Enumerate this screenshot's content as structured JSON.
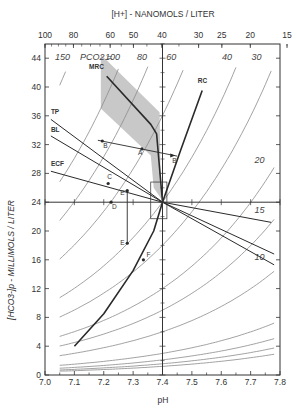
{
  "chart_data": {
    "type": "line",
    "title": "",
    "xlabel": "pH",
    "ylabel": "[HCO3-]p - MILLIMOLS / LITER",
    "top_axis_label": "[H+] - NANOMOLS / LITER",
    "xlim": [
      7.0,
      7.8
    ],
    "ylim": [
      0,
      46
    ],
    "x_ticks": [
      "7.0",
      "7.1",
      "7.2",
      "7.3",
      "7.4",
      "7.5",
      "7.6",
      "7.7",
      "7.8"
    ],
    "y_ticks": [
      "0",
      "4",
      "8",
      "12",
      "16",
      "20",
      "24",
      "28",
      "32",
      "36",
      "40",
      "44"
    ],
    "top_ticks": [
      "100",
      "80",
      "60",
      "50",
      "40",
      "30",
      "25",
      "20",
      "15"
    ],
    "grid": false,
    "isopleth_label_prefix": "PCO2 =",
    "isopleths": [
      {
        "pco2": 150,
        "label": "150"
      },
      {
        "pco2": 100,
        "label": "100"
      },
      {
        "pco2": 80,
        "label": "80"
      },
      {
        "pco2": 60,
        "label": "60"
      },
      {
        "pco2": 40,
        "label": "40"
      },
      {
        "pco2": 30,
        "label": "30"
      },
      {
        "pco2": 20,
        "label": "20"
      },
      {
        "pco2": 15,
        "label": "15"
      },
      {
        "pco2": 10,
        "label": "10"
      }
    ],
    "buffer_lines": [
      {
        "name": "TP",
        "from": [
          7.02,
          35.5
        ],
        "to": [
          7.4,
          24
        ]
      },
      {
        "name": "BL",
        "from": [
          7.02,
          33.2
        ],
        "to": [
          7.4,
          24
        ]
      },
      {
        "name": "ECF",
        "from": [
          7.02,
          28.3
        ],
        "to": [
          7.4,
          24
        ]
      },
      {
        "name": "ECF-ext",
        "from": [
          7.4,
          24
        ],
        "to": [
          7.77,
          21.2
        ]
      },
      {
        "name": "BL-ext",
        "from": [
          7.4,
          24
        ],
        "to": [
          7.78,
          16.8
        ]
      },
      {
        "name": "TP-ext",
        "from": [
          7.4,
          24
        ],
        "to": [
          7.78,
          15.3
        ]
      }
    ],
    "curves": [
      {
        "name": "MRC",
        "points": [
          [
            7.21,
            41.5
          ],
          [
            7.36,
            34.8
          ],
          [
            7.38,
            33.5
          ],
          [
            7.4,
            24
          ]
        ]
      },
      {
        "name": "RC",
        "points": [
          [
            7.4,
            24
          ],
          [
            7.46,
            31
          ],
          [
            7.535,
            39.5
          ]
        ]
      },
      {
        "name": "lower-curve",
        "points": [
          [
            7.1,
            4
          ],
          [
            7.2,
            8.5
          ],
          [
            7.3,
            14.5
          ],
          [
            7.37,
            20
          ],
          [
            7.4,
            24
          ]
        ]
      }
    ],
    "points": [
      {
        "label": "A",
        "x": 7.33,
        "y": 31.4
      },
      {
        "label": "B",
        "x": 7.195,
        "y": 32.5
      },
      {
        "label": "B'",
        "x": 7.44,
        "y": 30.5
      },
      {
        "label": "C",
        "x": 7.215,
        "y": 26.6
      },
      {
        "label": "D",
        "x": 7.225,
        "y": 24
      },
      {
        "label": "E'",
        "x": 7.28,
        "y": 25.6
      },
      {
        "label": "E",
        "x": 7.28,
        "y": 18.3
      },
      {
        "label": "F",
        "x": 7.335,
        "y": 16
      }
    ],
    "annotations": [
      "MRC",
      "RC",
      "TP",
      "BL",
      "ECF"
    ]
  },
  "colors": {
    "axis": "#333333",
    "curve": "#2a2a2a",
    "isopleth": "#8a8a8a",
    "band": "#c8c8c8"
  }
}
